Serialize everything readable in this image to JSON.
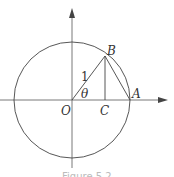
{
  "diagram": {
    "type": "unit-circle",
    "labels": {
      "origin": "O",
      "point_b": "B",
      "point_a": "A",
      "point_c": "C",
      "radius": "1",
      "angle": "θ"
    },
    "caption": "Figure 5.2"
  }
}
